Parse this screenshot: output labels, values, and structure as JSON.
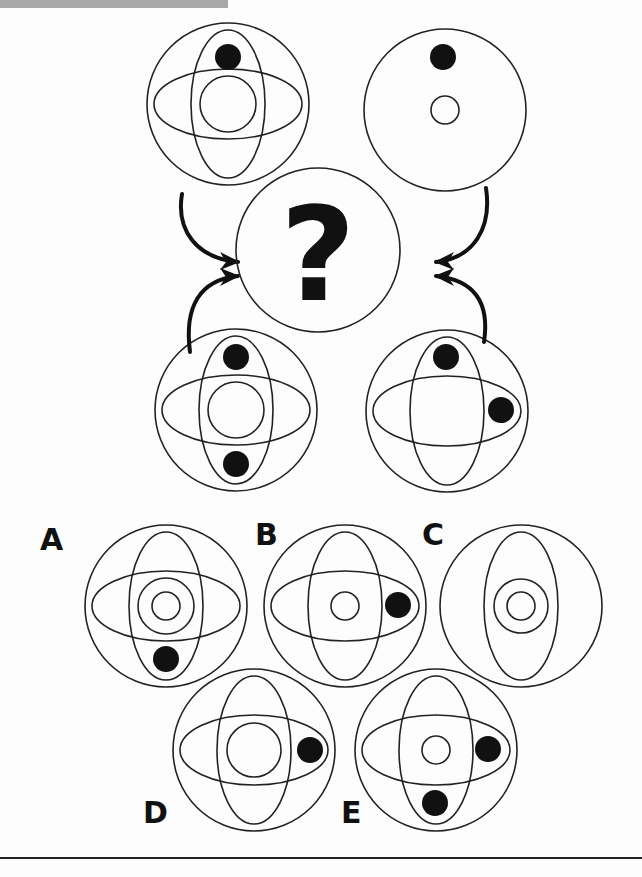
{
  "puzzle": {
    "type": "visual-reasoning-figure-combination",
    "question_mark": "?",
    "colors": {
      "stroke": "#222222",
      "fill_dot": "#111111",
      "background": "#fdfdfd",
      "top_bar": "#a8a8a8"
    },
    "sources": [
      {
        "id": "top-left",
        "cx": 228,
        "cy": 104,
        "horizontal_ellipse": true,
        "vertical_ellipse": true,
        "inner_circles": [
          28
        ],
        "dots": [
          [
            228,
            57
          ]
        ]
      },
      {
        "id": "top-right",
        "cx": 445,
        "cy": 110,
        "horizontal_ellipse": false,
        "vertical_ellipse": false,
        "inner_circles": [
          14
        ],
        "dots": [
          [
            443,
            57
          ]
        ]
      },
      {
        "id": "bottom-left",
        "cx": 236,
        "cy": 410,
        "horizontal_ellipse": true,
        "vertical_ellipse": true,
        "inner_circles": [
          28
        ],
        "dots": [
          [
            236,
            357
          ],
          [
            236,
            464
          ]
        ]
      },
      {
        "id": "bottom-right",
        "cx": 447,
        "cy": 411,
        "horizontal_ellipse": true,
        "vertical_ellipse": true,
        "inner_circles": [],
        "dots": [
          [
            446,
            357
          ],
          [
            501,
            410
          ]
        ]
      }
    ],
    "target": {
      "cx": 318,
      "cy": 250,
      "r": 82
    },
    "options": [
      {
        "label": "A",
        "label_pos": [
          40,
          525
        ],
        "cx": 166,
        "cy": 606,
        "horizontal_ellipse": true,
        "vertical_ellipse": true,
        "inner_circles": [
          28,
          14
        ],
        "dots": [
          [
            166,
            659
          ]
        ]
      },
      {
        "label": "B",
        "label_pos": [
          255,
          520
        ],
        "cx": 345,
        "cy": 606,
        "horizontal_ellipse": true,
        "vertical_ellipse": true,
        "inner_circles": [
          14
        ],
        "dots": [
          [
            398,
            605
          ]
        ]
      },
      {
        "label": "C",
        "label_pos": [
          422,
          520
        ],
        "cx": 521,
        "cy": 606,
        "horizontal_ellipse": false,
        "vertical_ellipse": true,
        "inner_circles": [
          27,
          14
        ],
        "dots": []
      },
      {
        "label": "D",
        "label_pos": [
          143,
          798
        ],
        "cx": 254,
        "cy": 750,
        "horizontal_ellipse": true,
        "vertical_ellipse": true,
        "inner_circles": [
          27
        ],
        "dots": [
          [
            310,
            750
          ]
        ]
      },
      {
        "label": "E",
        "label_pos": [
          341,
          798
        ],
        "cx": 436,
        "cy": 750,
        "horizontal_ellipse": true,
        "vertical_ellipse": true,
        "inner_circles": [
          14
        ],
        "dots": [
          [
            488,
            749
          ],
          [
            435,
            803
          ]
        ]
      }
    ],
    "geometry": {
      "outer_r": 81,
      "h_ellipse": [
        74,
        35
      ],
      "v_ellipse": [
        37,
        74
      ],
      "dot_r": 13
    }
  }
}
